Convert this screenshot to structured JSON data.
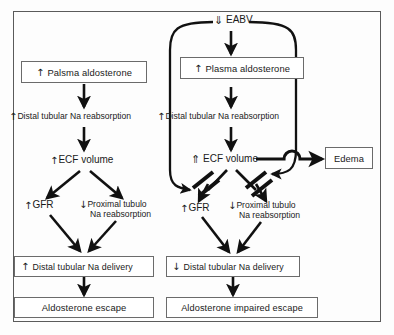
{
  "figure": {
    "frame_color": "#5a5a5a",
    "ink_color": "#1a1a1a"
  },
  "glyphs": {
    "up": "↑",
    "down": "↓",
    "up_double": "⇑",
    "down_double": "⇓"
  },
  "left_panel": {
    "plasma_aldosterone": "Palsma aldosterone",
    "plasma_aldosterone_arrow": "↑",
    "distal_reabsorption": "Distal tubular Na reabsorption",
    "distal_reabsorption_arrow": "↑",
    "ecf_volume": "ECF volume",
    "ecf_volume_arrow": "↑",
    "gfr": "GFR",
    "gfr_arrow": "↑",
    "proximal_line1": "Proximal tubulo",
    "proximal_line2": "Na reabsorption",
    "proximal_arrow": "↓",
    "distal_delivery": "Distal tubular Na delivery",
    "distal_delivery_arrow": "↑",
    "outcome": "Aldosterone escape"
  },
  "right_panel": {
    "eabv": "EABV",
    "eabv_arrow": "⇓",
    "plasma_aldosterone": "Plasma aldosterone",
    "plasma_aldosterone_arrow": "↑",
    "distal_reabsorption": "Distal tubular Na reabsorption",
    "distal_reabsorption_arrow": "↑",
    "ecf_volume": "ECF volume",
    "ecf_volume_arrow": "⇑",
    "gfr": "GFR",
    "gfr_arrow": "↑",
    "proximal_line1": "Proximal tubulo",
    "proximal_line2": "Na reabsorption",
    "proximal_arrow": "↓",
    "distal_delivery": "Distal tubular Na delivery",
    "distal_delivery_arrow": "↓",
    "outcome": "Aldosterone impaired escape",
    "edema": "Edema"
  }
}
